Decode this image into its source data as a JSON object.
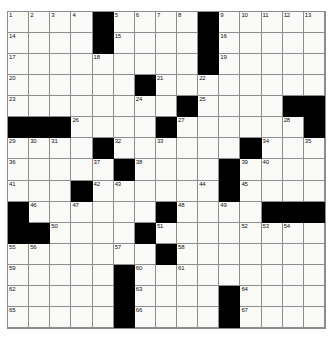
{
  "puzzle": {
    "title": "Crossword Puzzle Grid",
    "rows": 15,
    "columns": 15,
    "colors": {
      "background": "#ffffff",
      "cell_fill": "#fafaf8",
      "block_fill": "#000000",
      "grid_line": "#8d8d8d",
      "number_text": "#111111"
    },
    "grid": [
      [
        {
          "block": false,
          "number": "1"
        },
        {
          "block": false,
          "number": "2"
        },
        {
          "block": false,
          "number": "3"
        },
        {
          "block": false,
          "number": "4"
        },
        {
          "block": true,
          "number": ""
        },
        {
          "block": false,
          "number": "5"
        },
        {
          "block": false,
          "number": "6"
        },
        {
          "block": false,
          "number": "7"
        },
        {
          "block": false,
          "number": "8"
        },
        {
          "block": true,
          "number": ""
        },
        {
          "block": false,
          "number": "9"
        },
        {
          "block": false,
          "number": "10"
        },
        {
          "block": false,
          "number": "11"
        },
        {
          "block": false,
          "number": "12"
        },
        {
          "block": false,
          "number": "13"
        }
      ],
      [
        {
          "block": false,
          "number": "14"
        },
        {
          "block": false,
          "number": ""
        },
        {
          "block": false,
          "number": ""
        },
        {
          "block": false,
          "number": ""
        },
        {
          "block": true,
          "number": ""
        },
        {
          "block": false,
          "number": "15"
        },
        {
          "block": false,
          "number": ""
        },
        {
          "block": false,
          "number": ""
        },
        {
          "block": false,
          "number": ""
        },
        {
          "block": true,
          "number": ""
        },
        {
          "block": false,
          "number": "16"
        },
        {
          "block": false,
          "number": ""
        },
        {
          "block": false,
          "number": ""
        },
        {
          "block": false,
          "number": ""
        },
        {
          "block": false,
          "number": ""
        }
      ],
      [
        {
          "block": false,
          "number": "17"
        },
        {
          "block": false,
          "number": ""
        },
        {
          "block": false,
          "number": ""
        },
        {
          "block": false,
          "number": ""
        },
        {
          "block": false,
          "number": "18"
        },
        {
          "block": false,
          "number": ""
        },
        {
          "block": false,
          "number": ""
        },
        {
          "block": false,
          "number": ""
        },
        {
          "block": false,
          "number": ""
        },
        {
          "block": true,
          "number": ""
        },
        {
          "block": false,
          "number": "19"
        },
        {
          "block": false,
          "number": ""
        },
        {
          "block": false,
          "number": ""
        },
        {
          "block": false,
          "number": ""
        },
        {
          "block": false,
          "number": ""
        }
      ],
      [
        {
          "block": false,
          "number": "20"
        },
        {
          "block": false,
          "number": ""
        },
        {
          "block": false,
          "number": ""
        },
        {
          "block": false,
          "number": ""
        },
        {
          "block": false,
          "number": ""
        },
        {
          "block": false,
          "number": ""
        },
        {
          "block": true,
          "number": ""
        },
        {
          "block": false,
          "number": "21"
        },
        {
          "block": false,
          "number": ""
        },
        {
          "block": false,
          "number": "22"
        },
        {
          "block": false,
          "number": ""
        },
        {
          "block": false,
          "number": ""
        },
        {
          "block": false,
          "number": ""
        },
        {
          "block": false,
          "number": ""
        },
        {
          "block": false,
          "number": ""
        }
      ],
      [
        {
          "block": false,
          "number": "23"
        },
        {
          "block": false,
          "number": ""
        },
        {
          "block": false,
          "number": ""
        },
        {
          "block": false,
          "number": ""
        },
        {
          "block": false,
          "number": ""
        },
        {
          "block": false,
          "number": ""
        },
        {
          "block": false,
          "number": "24"
        },
        {
          "block": false,
          "number": ""
        },
        {
          "block": true,
          "number": ""
        },
        {
          "block": false,
          "number": "25"
        },
        {
          "block": false,
          "number": ""
        },
        {
          "block": false,
          "number": ""
        },
        {
          "block": false,
          "number": ""
        },
        {
          "block": true,
          "number": ""
        },
        {
          "block": true,
          "number": ""
        }
      ],
      [
        {
          "block": true,
          "number": ""
        },
        {
          "block": true,
          "number": ""
        },
        {
          "block": true,
          "number": ""
        },
        {
          "block": false,
          "number": "26"
        },
        {
          "block": false,
          "number": ""
        },
        {
          "block": false,
          "number": ""
        },
        {
          "block": false,
          "number": ""
        },
        {
          "block": true,
          "number": ""
        },
        {
          "block": false,
          "number": "27"
        },
        {
          "block": false,
          "number": ""
        },
        {
          "block": false,
          "number": ""
        },
        {
          "block": false,
          "number": ""
        },
        {
          "block": false,
          "number": ""
        },
        {
          "block": false,
          "number": "28"
        },
        {
          "block": true,
          "number": ""
        }
      ],
      [
        {
          "block": false,
          "number": "29"
        },
        {
          "block": false,
          "number": "30"
        },
        {
          "block": false,
          "number": "31"
        },
        {
          "block": false,
          "number": ""
        },
        {
          "block": true,
          "number": ""
        },
        {
          "block": false,
          "number": "32"
        },
        {
          "block": false,
          "number": ""
        },
        {
          "block": false,
          "number": "33"
        },
        {
          "block": false,
          "number": ""
        },
        {
          "block": false,
          "number": ""
        },
        {
          "block": false,
          "number": ""
        },
        {
          "block": true,
          "number": ""
        },
        {
          "block": false,
          "number": "34"
        },
        {
          "block": false,
          "number": ""
        },
        {
          "block": false,
          "number": "35"
        }
      ],
      [
        {
          "block": false,
          "number": "36"
        },
        {
          "block": false,
          "number": ""
        },
        {
          "block": false,
          "number": ""
        },
        {
          "block": false,
          "number": ""
        },
        {
          "block": false,
          "number": "37"
        },
        {
          "block": true,
          "number": ""
        },
        {
          "block": false,
          "number": "38"
        },
        {
          "block": false,
          "number": ""
        },
        {
          "block": false,
          "number": ""
        },
        {
          "block": false,
          "number": ""
        },
        {
          "block": true,
          "number": ""
        },
        {
          "block": false,
          "number": "39"
        },
        {
          "block": false,
          "number": "40"
        },
        {
          "block": false,
          "number": ""
        },
        {
          "block": false,
          "number": ""
        }
      ],
      [
        {
          "block": false,
          "number": "41"
        },
        {
          "block": false,
          "number": ""
        },
        {
          "block": false,
          "number": ""
        },
        {
          "block": true,
          "number": ""
        },
        {
          "block": false,
          "number": "42"
        },
        {
          "block": false,
          "number": "43"
        },
        {
          "block": false,
          "number": ""
        },
        {
          "block": false,
          "number": ""
        },
        {
          "block": false,
          "number": ""
        },
        {
          "block": false,
          "number": "44"
        },
        {
          "block": true,
          "number": ""
        },
        {
          "block": false,
          "number": "45"
        },
        {
          "block": false,
          "number": ""
        },
        {
          "block": false,
          "number": ""
        },
        {
          "block": false,
          "number": ""
        }
      ],
      [
        {
          "block": true,
          "number": ""
        },
        {
          "block": false,
          "number": "46"
        },
        {
          "block": false,
          "number": ""
        },
        {
          "block": false,
          "number": "47"
        },
        {
          "block": false,
          "number": ""
        },
        {
          "block": false,
          "number": ""
        },
        {
          "block": false,
          "number": ""
        },
        {
          "block": true,
          "number": ""
        },
        {
          "block": false,
          "number": "48"
        },
        {
          "block": false,
          "number": ""
        },
        {
          "block": false,
          "number": "49"
        },
        {
          "block": false,
          "number": ""
        },
        {
          "block": true,
          "number": ""
        },
        {
          "block": true,
          "number": ""
        },
        {
          "block": true,
          "number": ""
        }
      ],
      [
        {
          "block": true,
          "number": ""
        },
        {
          "block": true,
          "number": ""
        },
        {
          "block": false,
          "number": "50"
        },
        {
          "block": false,
          "number": ""
        },
        {
          "block": false,
          "number": ""
        },
        {
          "block": false,
          "number": ""
        },
        {
          "block": true,
          "number": ""
        },
        {
          "block": false,
          "number": "51"
        },
        {
          "block": false,
          "number": ""
        },
        {
          "block": false,
          "number": ""
        },
        {
          "block": false,
          "number": ""
        },
        {
          "block": false,
          "number": "52"
        },
        {
          "block": false,
          "number": "53"
        },
        {
          "block": false,
          "number": "54"
        },
        {
          "block": false,
          "number": ""
        }
      ],
      [
        {
          "block": false,
          "number": "55"
        },
        {
          "block": false,
          "number": "56"
        },
        {
          "block": false,
          "number": ""
        },
        {
          "block": false,
          "number": ""
        },
        {
          "block": false,
          "number": ""
        },
        {
          "block": false,
          "number": "57"
        },
        {
          "block": false,
          "number": ""
        },
        {
          "block": true,
          "number": ""
        },
        {
          "block": false,
          "number": "58"
        },
        {
          "block": false,
          "number": ""
        },
        {
          "block": false,
          "number": ""
        },
        {
          "block": false,
          "number": ""
        },
        {
          "block": false,
          "number": ""
        },
        {
          "block": false,
          "number": ""
        },
        {
          "block": false,
          "number": ""
        }
      ],
      [
        {
          "block": false,
          "number": "59"
        },
        {
          "block": false,
          "number": ""
        },
        {
          "block": false,
          "number": ""
        },
        {
          "block": false,
          "number": ""
        },
        {
          "block": false,
          "number": ""
        },
        {
          "block": true,
          "number": ""
        },
        {
          "block": false,
          "number": "60"
        },
        {
          "block": false,
          "number": ""
        },
        {
          "block": false,
          "number": "61"
        },
        {
          "block": false,
          "number": ""
        },
        {
          "block": false,
          "number": ""
        },
        {
          "block": false,
          "number": ""
        },
        {
          "block": false,
          "number": ""
        },
        {
          "block": false,
          "number": ""
        },
        {
          "block": false,
          "number": ""
        }
      ],
      [
        {
          "block": false,
          "number": "62"
        },
        {
          "block": false,
          "number": ""
        },
        {
          "block": false,
          "number": ""
        },
        {
          "block": false,
          "number": ""
        },
        {
          "block": false,
          "number": ""
        },
        {
          "block": true,
          "number": ""
        },
        {
          "block": false,
          "number": "63"
        },
        {
          "block": false,
          "number": ""
        },
        {
          "block": false,
          "number": ""
        },
        {
          "block": false,
          "number": ""
        },
        {
          "block": true,
          "number": ""
        },
        {
          "block": false,
          "number": "64"
        },
        {
          "block": false,
          "number": ""
        },
        {
          "block": false,
          "number": ""
        },
        {
          "block": false,
          "number": ""
        }
      ],
      [
        {
          "block": false,
          "number": "65"
        },
        {
          "block": false,
          "number": ""
        },
        {
          "block": false,
          "number": ""
        },
        {
          "block": false,
          "number": ""
        },
        {
          "block": false,
          "number": ""
        },
        {
          "block": true,
          "number": ""
        },
        {
          "block": false,
          "number": "66"
        },
        {
          "block": false,
          "number": ""
        },
        {
          "block": false,
          "number": ""
        },
        {
          "block": false,
          "number": ""
        },
        {
          "block": true,
          "number": ""
        },
        {
          "block": false,
          "number": "67"
        },
        {
          "block": false,
          "number": ""
        },
        {
          "block": false,
          "number": ""
        },
        {
          "block": false,
          "number": ""
        }
      ]
    ]
  }
}
